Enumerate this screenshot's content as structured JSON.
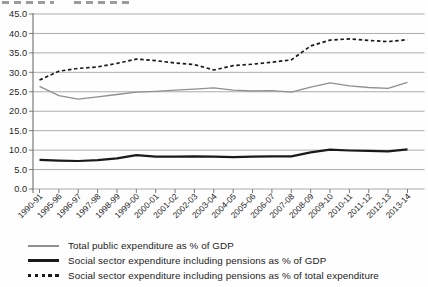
{
  "colors": {
    "gridline": "#a3a3a3",
    "axis": "#6e6e6e",
    "tick_label": "#1f1f1f",
    "series_grey": "#8f8f8f",
    "series_black": "#1a1a1a"
  },
  "chart_data": {
    "type": "line",
    "title": "",
    "categories": [
      "1990-91",
      "1995-96",
      "1996-97",
      "1997-98",
      "1998-99",
      "1999-00",
      "2000-01",
      "2001-02",
      "2002-03",
      "2003-04",
      "2004-05",
      "2005-06",
      "2006-07",
      "2007-08",
      "2008-09",
      "2009-10",
      "2010-11",
      "2011-12",
      "2012-13",
      "2013-14"
    ],
    "series": [
      {
        "name": "Total public expenditure as % of GDP",
        "style": "solid",
        "color": "#8f8f8f",
        "stroke_width": 1.3,
        "values": [
          26.4,
          24.0,
          23.1,
          23.7,
          24.3,
          24.9,
          25.1,
          25.4,
          25.7,
          26.0,
          25.4,
          25.2,
          25.3,
          24.9,
          26.2,
          27.3,
          26.5,
          26.1,
          25.9,
          27.4
        ]
      },
      {
        "name": "Social sector expenditure including pensions as % of GDP",
        "style": "solid",
        "color": "#1a1a1a",
        "stroke_width": 2.2,
        "values": [
          7.5,
          7.3,
          7.2,
          7.4,
          7.9,
          8.7,
          8.3,
          8.3,
          8.4,
          8.3,
          8.2,
          8.3,
          8.4,
          8.4,
          9.4,
          10.1,
          9.9,
          9.8,
          9.7,
          10.2
        ]
      },
      {
        "name": "Social sector expenditure including pensions as % of total expenditure",
        "style": "dashed",
        "color": "#1a1a1a",
        "stroke_width": 1.7,
        "values": [
          28.0,
          30.3,
          31.0,
          31.4,
          32.3,
          33.4,
          33.0,
          32.4,
          32.0,
          30.6,
          31.7,
          32.1,
          32.6,
          33.2,
          36.8,
          38.3,
          38.6,
          38.2,
          37.9,
          38.4
        ]
      }
    ],
    "ylim": [
      0,
      45
    ],
    "ytick_step": 5,
    "ytick_labels": [
      "0.0",
      "5.0",
      "10.0",
      "15.0",
      "20.0",
      "25.0",
      "30.0",
      "35.0",
      "40.0",
      "45.0"
    ],
    "grid": true,
    "legend_position": "bottom"
  }
}
